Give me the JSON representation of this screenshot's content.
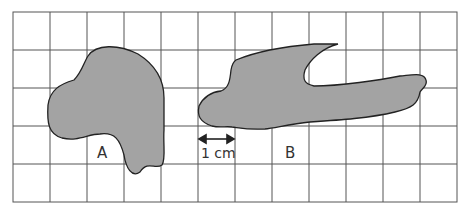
{
  "grid": {
    "columns": 12,
    "rows": 5,
    "cell_size_label": "1 cm",
    "line_color": "#555555"
  },
  "shapes": [
    {
      "label": "A",
      "fill": "#a3a3a3"
    },
    {
      "label": "B",
      "fill": "#a3a3a3"
    }
  ],
  "scale": {
    "label": "1 cm"
  }
}
